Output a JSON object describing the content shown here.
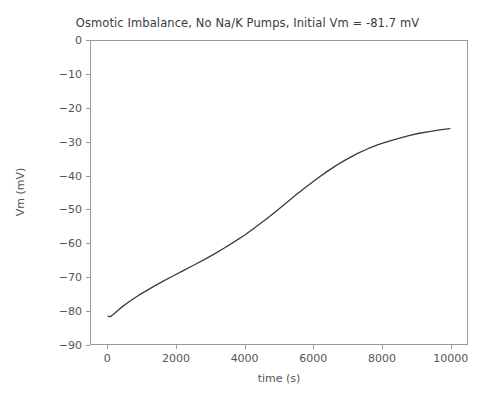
{
  "chart_data": {
    "type": "line",
    "title": "Osmotic Imbalance, No Na/K Pumps, Initial Vm = -81.7 mV",
    "xlabel": "time (s)",
    "ylabel": "Vm (mV)",
    "xlim": [
      -500,
      10500
    ],
    "ylim": [
      -90,
      0
    ],
    "xticks": [
      0,
      2000,
      4000,
      6000,
      8000,
      10000
    ],
    "xtick_labels": [
      "0",
      "2000",
      "4000",
      "6000",
      "8000",
      "10000"
    ],
    "yticks": [
      0,
      -10,
      -20,
      -30,
      -40,
      -50,
      -60,
      -70,
      -80,
      -90
    ],
    "ytick_labels": [
      "0",
      "−10",
      "−20",
      "−30",
      "−40",
      "−50",
      "−60",
      "−70",
      "−80",
      "−90"
    ],
    "grid": false,
    "legend": null,
    "line_color": "#3b3b3b",
    "line_width": 1.3,
    "series": [
      {
        "name": "Vm",
        "x": [
          0,
          40,
          80,
          130,
          200,
          300,
          420,
          560,
          720,
          900,
          1100,
          1350,
          1600,
          1900,
          2200,
          2500,
          2800,
          3100,
          3400,
          3700,
          4000,
          4300,
          4600,
          4900,
          5200,
          5500,
          5800,
          6100,
          6400,
          6700,
          7000,
          7300,
          7600,
          7900,
          8200,
          8500,
          8800,
          9100,
          9400,
          9700,
          10000
        ],
        "y": [
          -81.7,
          -81.9,
          -81.8,
          -81.4,
          -80.8,
          -79.9,
          -78.9,
          -77.8,
          -76.7,
          -75.5,
          -74.3,
          -72.8,
          -71.4,
          -69.8,
          -68.2,
          -66.6,
          -65.0,
          -63.3,
          -61.5,
          -59.6,
          -57.6,
          -55.4,
          -53.1,
          -50.7,
          -48.2,
          -45.7,
          -43.3,
          -41.0,
          -38.8,
          -36.8,
          -35.0,
          -33.4,
          -32.0,
          -30.8,
          -29.8,
          -28.9,
          -28.1,
          -27.4,
          -26.9,
          -26.4,
          -26.0
        ]
      }
    ]
  },
  "figure": {
    "background_color": "#ffffff",
    "axes_color": "#9a9a9a",
    "text_color": "#555555",
    "title_color": "#3b3b3b"
  }
}
